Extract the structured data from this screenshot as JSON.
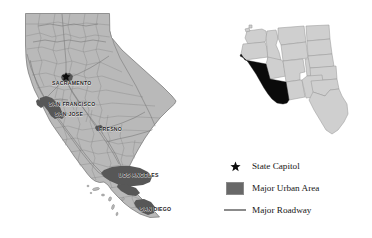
{
  "figure": {
    "name": "california-reference-map",
    "background_color": "#ffffff"
  },
  "colors": {
    "state_fill": "#b9b9b9",
    "state_outline": "#6e6e6e",
    "county_line": "#8d8d8d",
    "urban_area": "#575757",
    "roadway": "#7a7a7a",
    "inset_state_fill": "#cfcfcf",
    "inset_state_line": "#9a9a9a",
    "inset_highlight": "#0a0a0a",
    "label_text": "#1b1b1b",
    "legend_text": "#161616"
  },
  "main_map": {
    "name": "california-state-map",
    "cities": [
      {
        "label": "SACRAMENTO",
        "x": 52,
        "y": 82,
        "capital": true,
        "star_x": 66,
        "star_y": 76
      },
      {
        "label": "SAN FRANCISCO",
        "x": 49,
        "y": 104
      },
      {
        "label": "SAN JOSE",
        "x": 55,
        "y": 114
      },
      {
        "label": "FRESNO",
        "x": 99,
        "y": 129
      },
      {
        "label": "LOS ANGELES",
        "x": 119,
        "y": 175
      },
      {
        "label": "SAN DIEGO",
        "x": 140,
        "y": 209
      }
    ]
  },
  "inset_map": {
    "name": "western-united-states-inset",
    "highlighted_state": "California"
  },
  "legend": {
    "name": "map-legend",
    "items": [
      {
        "key": "star-icon",
        "label": "State Capitol"
      },
      {
        "key": "urban-swatch",
        "label": "Major Urban Area"
      },
      {
        "key": "roadway-line",
        "label": "Major Roadway"
      }
    ]
  }
}
